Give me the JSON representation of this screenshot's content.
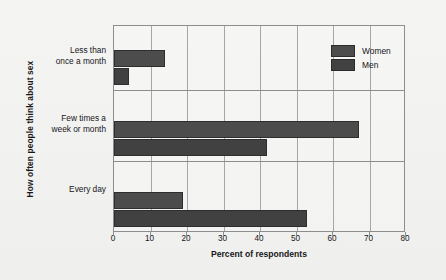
{
  "chart_data": {
    "type": "bar",
    "orientation": "horizontal",
    "title": "",
    "xlabel": "Percent of respondents",
    "ylabel": "How often people think about sex",
    "categories": [
      "Less than once a month",
      "Few times a week or month",
      "Every day"
    ],
    "category_label_lines": [
      [
        "Less than",
        "once a month"
      ],
      [
        "Few times a",
        "week or month"
      ],
      [
        "Every day"
      ]
    ],
    "series": [
      {
        "name": "Women",
        "values": [
          14,
          67,
          19
        ],
        "color": "#4c4c4c"
      },
      {
        "name": "Men",
        "values": [
          4,
          42,
          53
        ],
        "color": "#414141"
      }
    ],
    "xlim": [
      0,
      80
    ],
    "xticks": [
      0,
      10,
      20,
      30,
      40,
      50,
      60,
      70,
      80
    ],
    "xtick_labels": [
      "0",
      "10",
      "20",
      "30",
      "40",
      "50",
      "60",
      "70",
      "80"
    ],
    "grid": "vertical",
    "legend_position": "top-right",
    "legend_entries": [
      "Women",
      "Men"
    ],
    "background_color": "#f2f2f0",
    "axis_color": "#8d8d90",
    "grid_color": "#a6a6a9"
  }
}
